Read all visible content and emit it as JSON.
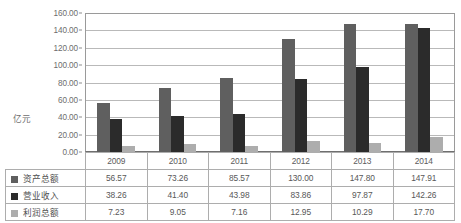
{
  "chart_data": {
    "type": "bar",
    "title": "",
    "subtitle": "",
    "xlabel": "",
    "ylabel": "亿元",
    "ylim": [
      0,
      160
    ],
    "ytick_step": 20,
    "ytick_labels": [
      "0.00",
      "20.00",
      "40.00",
      "60.00",
      "80.00",
      "100.00",
      "120.00",
      "140.00",
      "160.00"
    ],
    "grid": true,
    "legend_position": "table-row-headers",
    "categories": [
      "2009",
      "2010",
      "2011",
      "2012",
      "2013",
      "2014"
    ],
    "series": [
      {
        "name": "资产总额",
        "color": "#5f5f5f",
        "values": [
          56.57,
          73.26,
          85.57,
          130.0,
          147.8,
          147.91
        ],
        "labels": [
          "56.57",
          "73.26",
          "85.57",
          "130.00",
          "147.80",
          "147.91"
        ]
      },
      {
        "name": "营业收入",
        "color": "#2b2b2b",
        "values": [
          38.26,
          41.4,
          43.98,
          83.86,
          97.87,
          142.26
        ],
        "labels": [
          "38.26",
          "41.40",
          "43.98",
          "83.86",
          "97.87",
          "142.26"
        ]
      },
      {
        "name": "利润总额",
        "color": "#adadad",
        "values": [
          7.23,
          9.05,
          7.16,
          12.95,
          10.29,
          17.7
        ],
        "labels": [
          "7.23",
          "9.05",
          "7.16",
          "12.95",
          "10.29",
          "17.70"
        ]
      }
    ]
  },
  "table": {
    "year_row_header": "",
    "years": [
      "2009",
      "2010",
      "2011",
      "2012",
      "2013",
      "2014"
    ],
    "rows": [
      {
        "label": "资产总额",
        "swatch": "series-0-swatch",
        "values": [
          "56.57",
          "73.26",
          "85.57",
          "130.00",
          "147.80",
          "147.91"
        ]
      },
      {
        "label": "营业收入",
        "swatch": "series-1-swatch",
        "values": [
          "38.26",
          "41.40",
          "43.98",
          "83.86",
          "97.87",
          "142.26"
        ]
      },
      {
        "label": "利润总额",
        "swatch": "series-2-swatch",
        "values": [
          "7.23",
          "9.05",
          "7.16",
          "12.95",
          "10.29",
          "17.70"
        ]
      }
    ]
  },
  "colors": {
    "series_0": "#5f5f5f",
    "series_1": "#2b2b2b",
    "series_2": "#adadad",
    "gridline": "#b9b9b9",
    "axis": "#8d8d8d",
    "table_border": "#adadad",
    "text": "#585858",
    "background": "#ffffff"
  }
}
